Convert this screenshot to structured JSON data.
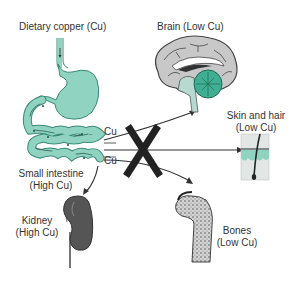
{
  "diagram": {
    "labels": {
      "dietary": "Dietary copper (Cu)",
      "brain": "Brain (Low Cu)",
      "skin_line1": "Skin and hair",
      "skin_line2": "(Low Cu)",
      "intestine_line1": "Small intestine",
      "intestine_line2": "(High Cu)",
      "kidney_line1": "Kidney",
      "kidney_line2": "(High Cu)",
      "bones_line1": "Bones",
      "bones_line2": "(Low Cu)",
      "cu_top": "Cu",
      "cu_bottom": "Cu"
    },
    "colors": {
      "gut": "#8fd3c0",
      "gut_outline": "#3a8a78",
      "brain_gray": "#c8c8c8",
      "cerebellum": "#3fae92",
      "kidney": "#555555",
      "bone": "#9a9a9a",
      "block_x": "#222222"
    }
  }
}
